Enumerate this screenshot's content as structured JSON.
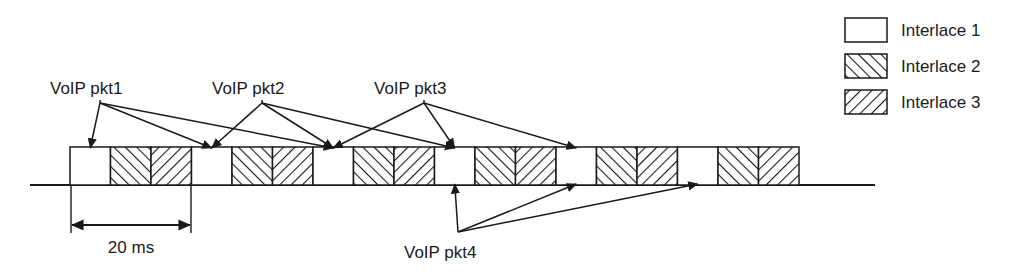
{
  "figure": {
    "stroke_color": "#1a1a1a",
    "fill_color": "#ffffff",
    "hatch_color": "#1a1a1a"
  },
  "timeline": {
    "cell_count": 18,
    "cell_width": 40.5,
    "cell_height": 38,
    "origin_x": 70,
    "baseline_y": 185,
    "axis_start_x": 30,
    "axis_end_x": 875,
    "pattern_cycle": [
      "interlace1",
      "interlace2",
      "interlace3"
    ],
    "cells": [
      {
        "index": 0,
        "pattern": "interlace1"
      },
      {
        "index": 1,
        "pattern": "interlace2"
      },
      {
        "index": 2,
        "pattern": "interlace3"
      },
      {
        "index": 3,
        "pattern": "interlace1"
      },
      {
        "index": 4,
        "pattern": "interlace2"
      },
      {
        "index": 5,
        "pattern": "interlace3"
      },
      {
        "index": 6,
        "pattern": "interlace1"
      },
      {
        "index": 7,
        "pattern": "interlace2"
      },
      {
        "index": 8,
        "pattern": "interlace3"
      },
      {
        "index": 9,
        "pattern": "interlace1"
      },
      {
        "index": 10,
        "pattern": "interlace2"
      },
      {
        "index": 11,
        "pattern": "interlace3"
      },
      {
        "index": 12,
        "pattern": "interlace1"
      },
      {
        "index": 13,
        "pattern": "interlace2"
      },
      {
        "index": 14,
        "pattern": "interlace3"
      },
      {
        "index": 15,
        "pattern": "interlace1"
      },
      {
        "index": 16,
        "pattern": "interlace2"
      },
      {
        "index": 17,
        "pattern": "interlace3"
      }
    ]
  },
  "packet_labels": [
    {
      "id": "pkt1",
      "text": "VoIP pkt1",
      "x": 50,
      "y": 94,
      "origin_x": 100,
      "origin_y": 103,
      "direction": "above"
    },
    {
      "id": "pkt2",
      "text": "VoIP pkt2",
      "x": 212,
      "y": 94,
      "origin_x": 262,
      "origin_y": 103,
      "direction": "above"
    },
    {
      "id": "pkt3",
      "text": "VoIP pkt3",
      "x": 374,
      "y": 94,
      "origin_x": 424,
      "origin_y": 103,
      "direction": "above"
    },
    {
      "id": "pkt4",
      "text": "VoIP pkt4",
      "x": 404,
      "y": 258,
      "origin_x": 458,
      "origin_y": 232,
      "direction": "below"
    }
  ],
  "dimension": {
    "label": "20 ms",
    "label_x": 131,
    "label_y": 253,
    "start_x": 71,
    "end_x": 191,
    "arrow_y": 225,
    "tick_top_y": 186,
    "tick_bottom_y": 233
  },
  "legend": {
    "x": 845,
    "y": 18,
    "swatch_width": 42,
    "swatch_height": 24,
    "row_spacing": 36,
    "items": [
      {
        "label": "Interlace 1",
        "pattern": "interlace1"
      },
      {
        "label": "Interlace 2",
        "pattern": "interlace2"
      },
      {
        "label": "Interlace 3",
        "pattern": "interlace3"
      }
    ]
  }
}
